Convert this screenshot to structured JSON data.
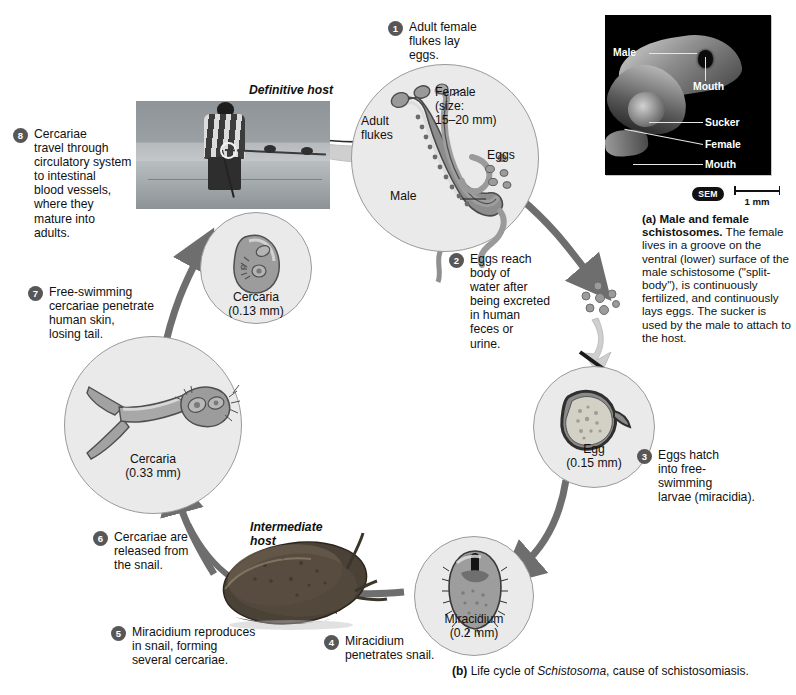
{
  "figure": {
    "caption_a_title": "(a) Male and female schistosomes.",
    "caption_a_body": "The female lives in a groove on the ventral (lower) surface of the male schistosome (\"split-body\"), is continuously fertilized, and continuously lays eggs. The sucker is used by the male to attach to the host.",
    "caption_b_prefix": "(b)",
    "caption_b_text1": " Life cycle of ",
    "caption_b_italic": "Schistosoma",
    "caption_b_text2": ", cause of schistosomiasis."
  },
  "sem": {
    "badge": "SEM",
    "scale_label": "1 mm",
    "labels": {
      "male": "Male",
      "mouth_top": "Mouth",
      "sucker": "Sucker",
      "female": "Female",
      "mouth_bottom": "Mouth"
    }
  },
  "hosts": {
    "definitive": "Definitive host",
    "intermediate": "Intermediate\nhost"
  },
  "stages": [
    {
      "name": "adult-flukes",
      "label": "Adult\nflukes"
    },
    {
      "name": "female-size",
      "label": "Female\n(size:\n15–20 mm)"
    },
    {
      "name": "male",
      "label": "Male"
    },
    {
      "name": "eggs",
      "label": "Eggs"
    },
    {
      "name": "cercaria-small",
      "label": "Cercaria\n(0.13 mm)"
    },
    {
      "name": "cercaria-large",
      "label": "Cercaria\n(0.33 mm)"
    },
    {
      "name": "egg",
      "label": "Egg\n(0.15 mm)"
    },
    {
      "name": "miracidium",
      "label": "Miracidium\n(0.2 mm)"
    }
  ],
  "steps": [
    {
      "num": "1",
      "text": "Adult female\nflukes lay\neggs."
    },
    {
      "num": "2",
      "text": "Eggs reach\nbody of\nwater after\nbeing excreted\nin human\nfeces or\nurine."
    },
    {
      "num": "3",
      "text": "Eggs hatch\ninto free-\nswimming\nlarvae (miracidia)."
    },
    {
      "num": "4",
      "text": "Miracidium\npenetrates snail."
    },
    {
      "num": "5",
      "text": "Miracidium reproduces\nin snail, forming\nseveral cercariae."
    },
    {
      "num": "6",
      "text": "Cercariae are\nreleased from\nthe snail."
    },
    {
      "num": "7",
      "text": "Free-swimming\ncercariae penetrate\nhuman skin,\nlosing tail."
    },
    {
      "num": "8",
      "text": "Cercariae\ntravel through\ncirculatory system\nto intestinal\nblood vessels,\nwhere they\nmature into\nadults."
    }
  ],
  "colors": {
    "badge": "#575757",
    "circle_fill": "#eaeaea",
    "circle_stroke": "#9a9a9a",
    "arrow": "#6e6e6e",
    "arrow_light": "#c9c9c9",
    "text": "#111111",
    "sem_background": "#000000"
  }
}
